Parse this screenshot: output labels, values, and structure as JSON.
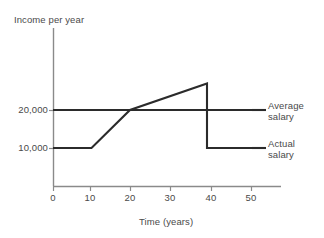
{
  "chart_data": {
    "type": "line",
    "title": "",
    "xlabel": "Time (years)",
    "ylabel": "Income per year",
    "xlim": [
      0,
      57
    ],
    "ylim": [
      0,
      35000
    ],
    "grid": false,
    "legend_position": "right-inline",
    "xticks": [
      0,
      10,
      20,
      30,
      40,
      50
    ],
    "xtick_labels": [
      "0",
      "10",
      "20",
      "30",
      "40",
      "50"
    ],
    "yticks": [
      10000,
      20000
    ],
    "ytick_labels": [
      "10,000",
      "20,000"
    ],
    "series": [
      {
        "name": "Average salary",
        "label_line1": "Average",
        "label_line2": "salary",
        "color": "#2b2b2b",
        "x": [
          0,
          57
        ],
        "values": [
          20000,
          20000
        ]
      },
      {
        "name": "Actual salary",
        "label_line1": "Actual",
        "label_line2": "salary",
        "color": "#2b2b2b",
        "x": [
          0,
          10,
          20,
          40,
          40,
          57
        ],
        "values": [
          10000,
          10000,
          20000,
          27000,
          10000,
          10000
        ]
      }
    ],
    "annotations": []
  },
  "axes": {
    "y_axis_title": "Income per year",
    "x_axis_title": "Time (years)",
    "axis_color": "#8a8a8a"
  },
  "ticks": {
    "x": {
      "t0": "0",
      "t10": "10",
      "t20": "20",
      "t30": "30",
      "t40": "40",
      "t50": "50"
    },
    "y": {
      "t10000": "10,000",
      "t20000": "20,000"
    }
  },
  "legend": {
    "average": {
      "line1": "Average",
      "line2": "salary"
    },
    "actual": {
      "line1": "Actual",
      "line2": "salary"
    }
  }
}
